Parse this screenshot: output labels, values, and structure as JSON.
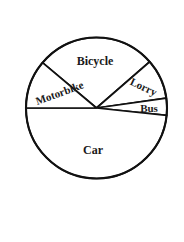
{
  "chart_data": {
    "type": "pie",
    "title": "",
    "subtitle": "",
    "xlabel": "",
    "ylabel": "",
    "grid": false,
    "legend_position": "none",
    "labels_inside_slices": true,
    "center": {
      "x": 96.5,
      "y": 108
    },
    "radius": 70.5,
    "stroke_color": "#111111",
    "fill_color": "#ffffff",
    "background_color": "#ffffff",
    "categories": [
      "Bicycle",
      "Lorry",
      "Bus",
      "Car",
      "Motorbike"
    ],
    "values": [
      99,
      33,
      14,
      174,
      40
    ],
    "units": "degrees",
    "slices": [
      {
        "label": "Bicycle",
        "start_angle": 41,
        "end_angle": 140,
        "sweep": 99,
        "percent": 27.5,
        "label_x": 95,
        "label_y": 62,
        "label_rotation": 0,
        "font_size": 12
      },
      {
        "label": "Lorry",
        "start_angle": 8,
        "end_angle": 41,
        "sweep": 33,
        "percent": 9.2,
        "label_x": 143,
        "label_y": 88,
        "label_rotation": 25,
        "font_size": 11
      },
      {
        "label": "Bus",
        "start_angle": -6,
        "end_angle": 8,
        "sweep": 14,
        "percent": 3.9,
        "label_x": 149,
        "label_y": 109,
        "label_rotation": 0,
        "font_size": 11
      },
      {
        "label": "Car",
        "start_angle": -180,
        "end_angle": -6,
        "sweep": 174,
        "percent": 48.3,
        "label_x": 93,
        "label_y": 151,
        "label_rotation": 0,
        "font_size": 12
      },
      {
        "label": "Motorbike",
        "start_angle": 140,
        "end_angle": 180,
        "sweep": 40,
        "percent": 11.1,
        "label_x": 60,
        "label_y": 94,
        "label_rotation": -20,
        "font_size": 11
      }
    ]
  }
}
